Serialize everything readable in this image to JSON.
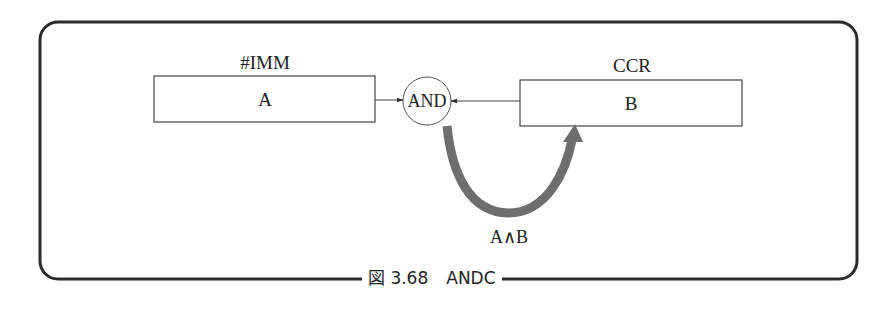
{
  "figure": {
    "caption": "図 3.68　ANDC",
    "caption_number": "図 3.68",
    "caption_title": "ANDC"
  },
  "diagram": {
    "source_box": {
      "header": "#IMM",
      "content": "A"
    },
    "operator": {
      "label": "AND"
    },
    "dest_box": {
      "header": "CCR",
      "content": "B"
    },
    "result_arrow": {
      "label": "A∧B"
    }
  },
  "colors": {
    "frame": "#2b2b2b",
    "box_stroke": "#444444",
    "result_arrow": "#6e6e6e",
    "text": "#222222"
  }
}
